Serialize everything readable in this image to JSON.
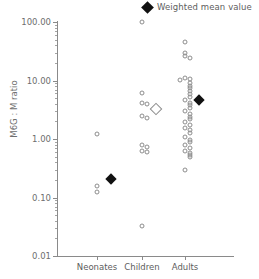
{
  "legend": {
    "marker_icon": "black-diamond-icon",
    "label": "Weighted mean value"
  },
  "chart_data": {
    "type": "scatter",
    "title": "",
    "xlabel": "",
    "ylabel": "M6G : M ratio",
    "yscale": "log",
    "ylim": [
      0.01,
      100
    ],
    "ytick_labels": [
      "100.00",
      "10.00",
      "1.00",
      "0.10",
      "0.01"
    ],
    "ytick_values": [
      100,
      10,
      1,
      0.1,
      0.01
    ],
    "grid": false,
    "legend_position": "top-right",
    "categories": [
      "Neonates",
      "Children",
      "Adults"
    ],
    "series": [
      {
        "name": "Individual study values",
        "marker": "open-gray-circle",
        "groups": [
          {
            "category": "Neonates",
            "values": [
              1.2,
              0.155,
              0.122
            ]
          },
          {
            "category": "Children",
            "values": [
              100,
              6.1,
              4.1,
              3.9,
              2.5,
              2.3,
              0.8,
              0.72,
              0.63,
              0.6,
              0.032
            ]
          },
          {
            "category": "Adults",
            "values": [
              45,
              30,
              26,
              24,
              11.2,
              10.8,
              10.2,
              9.2,
              8.2,
              7.4,
              6.6,
              5.9,
              5.3,
              4.7,
              4.2,
              3.8,
              3.4,
              3.0,
              2.7,
              2.4,
              2.2,
              1.95,
              1.75,
              1.55,
              1.4,
              1.25,
              1.1,
              0.98,
              0.88,
              0.78,
              0.7,
              0.62,
              0.57,
              0.53,
              0.5,
              0.3
            ]
          }
        ]
      },
      {
        "name": "Weighted mean value",
        "marker": "black-diamond",
        "points": [
          {
            "category": "Neonates",
            "value": 0.21,
            "filled": true
          },
          {
            "category": "Children",
            "value": 3.2,
            "filled": false
          },
          {
            "category": "Adults",
            "value": 4.7,
            "filled": true
          }
        ]
      }
    ]
  }
}
